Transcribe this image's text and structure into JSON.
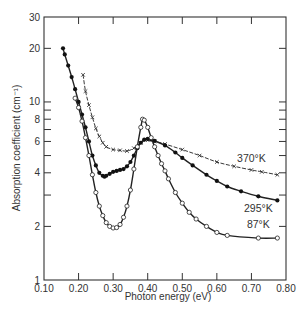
{
  "chart_data": {
    "type": "line",
    "title": "",
    "xlabel": "Photon energy (eV)",
    "ylabel": "Absorption coefficient (cm⁻¹)",
    "xlim": [
      0.1,
      0.8
    ],
    "ylim": [
      1,
      30
    ],
    "yscale": "log",
    "grid": false,
    "x_ticks": [
      "0.10",
      "0.20",
      "0.30",
      "0.40",
      "0.50",
      "0.60",
      "0.70",
      "0.80"
    ],
    "y_ticks": [
      {
        "value": 1,
        "label": "1"
      },
      {
        "value": 2,
        "label": "2"
      },
      {
        "value": 3,
        "label": ""
      },
      {
        "value": 4,
        "label": "4"
      },
      {
        "value": 5,
        "label": ""
      },
      {
        "value": 6,
        "label": "6"
      },
      {
        "value": 7,
        "label": ""
      },
      {
        "value": 8,
        "label": "8"
      },
      {
        "value": 9,
        "label": ""
      },
      {
        "value": 10,
        "label": "10"
      },
      {
        "value": 20,
        "label": "20"
      },
      {
        "value": 30,
        "label": "30"
      }
    ],
    "series": [
      {
        "name": "370°K",
        "marker": "x",
        "label_pos": [
          0.7,
          4.6
        ],
        "x": [
          0.213,
          0.22,
          0.23,
          0.24,
          0.25,
          0.26,
          0.27,
          0.28,
          0.3,
          0.32,
          0.34,
          0.36,
          0.38,
          0.4,
          0.42,
          0.45,
          0.5,
          0.55,
          0.6,
          0.65,
          0.7,
          0.73,
          0.775
        ],
        "y": [
          14.2,
          11.5,
          9.6,
          8.2,
          7.1,
          6.4,
          5.9,
          5.6,
          5.4,
          5.35,
          5.3,
          5.5,
          5.9,
          6.1,
          6.0,
          5.8,
          5.4,
          5.0,
          4.6,
          4.35,
          4.15,
          4.05,
          3.9
        ]
      },
      {
        "name": "295°K",
        "marker": "filled-circle",
        "label_pos": [
          0.72,
          2.4
        ],
        "x": [
          0.155,
          0.16,
          0.17,
          0.18,
          0.19,
          0.2,
          0.21,
          0.22,
          0.23,
          0.24,
          0.25,
          0.26,
          0.27,
          0.275,
          0.28,
          0.29,
          0.3,
          0.31,
          0.32,
          0.33,
          0.34,
          0.35,
          0.36,
          0.37,
          0.38,
          0.39,
          0.4,
          0.41,
          0.42,
          0.45,
          0.48,
          0.5,
          0.53,
          0.57,
          0.6,
          0.63,
          0.67,
          0.72,
          0.775
        ],
        "y": [
          20.0,
          18.5,
          16.0,
          13.8,
          11.8,
          10.0,
          8.5,
          7.2,
          6.0,
          5.0,
          4.4,
          4.0,
          3.85,
          3.8,
          3.85,
          3.95,
          4.05,
          4.1,
          4.15,
          4.2,
          4.35,
          4.6,
          5.0,
          5.5,
          5.9,
          6.15,
          6.2,
          6.15,
          6.05,
          5.7,
          5.2,
          4.85,
          4.4,
          3.9,
          3.6,
          3.35,
          3.15,
          2.95,
          2.8
        ]
      },
      {
        "name": "87°K",
        "marker": "open-circle",
        "label_pos": [
          0.72,
          1.95
        ],
        "x": [
          0.19,
          0.2,
          0.21,
          0.22,
          0.23,
          0.24,
          0.25,
          0.26,
          0.27,
          0.28,
          0.29,
          0.3,
          0.31,
          0.32,
          0.33,
          0.34,
          0.35,
          0.36,
          0.37,
          0.38,
          0.385,
          0.39,
          0.4,
          0.41,
          0.42,
          0.43,
          0.44,
          0.45,
          0.46,
          0.48,
          0.5,
          0.52,
          0.54,
          0.57,
          0.6,
          0.63,
          0.72,
          0.775
        ],
        "y": [
          10.5,
          9.3,
          7.8,
          6.3,
          5.0,
          3.9,
          3.1,
          2.6,
          2.3,
          2.1,
          2.0,
          1.96,
          1.97,
          2.05,
          2.25,
          2.6,
          3.2,
          4.2,
          5.6,
          7.2,
          8.0,
          7.9,
          7.2,
          6.3,
          5.6,
          5.0,
          4.5,
          4.1,
          3.7,
          3.1,
          2.7,
          2.4,
          2.2,
          2.0,
          1.85,
          1.78,
          1.72,
          1.72
        ]
      }
    ]
  }
}
